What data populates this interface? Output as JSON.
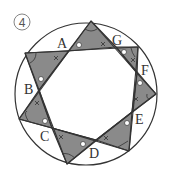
{
  "figure": {
    "number_label": "4",
    "colors": {
      "fill": "#8a8a8a",
      "stroke": "#333333",
      "background": "#ffffff"
    },
    "circle": {
      "cx": 86,
      "cy": 94,
      "r": 71
    },
    "points": {
      "A": {
        "label": "A",
        "x": 69,
        "y": 51,
        "lx": 57,
        "ly": 48
      },
      "G": {
        "label": "G",
        "x": 116,
        "y": 47,
        "lx": 112,
        "ly": 45
      },
      "F": {
        "label": "F",
        "x": 137,
        "y": 73,
        "lx": 141,
        "ly": 75
      },
      "E": {
        "label": "E",
        "x": 132,
        "y": 112,
        "lx": 135,
        "ly": 124
      },
      "D": {
        "label": "D",
        "x": 96,
        "y": 140,
        "lx": 89,
        "ly": 158
      },
      "C": {
        "label": "C",
        "x": 52,
        "y": 128,
        "lx": 40,
        "ly": 141
      },
      "B": {
        "label": "B",
        "x": 39,
        "y": 90,
        "lx": 24,
        "ly": 94
      }
    },
    "tips": [
      {
        "x": 91,
        "y": 21
      },
      {
        "x": 25,
        "y": 53
      },
      {
        "x": 19,
        "y": 119
      },
      {
        "x": 67,
        "y": 164
      },
      {
        "x": 129,
        "y": 151
      },
      {
        "x": 156,
        "y": 94
      },
      {
        "x": 138,
        "y": 47
      }
    ]
  }
}
